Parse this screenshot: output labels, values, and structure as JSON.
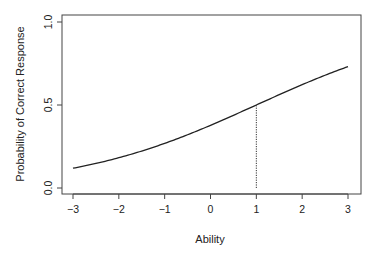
{
  "chart_data": {
    "type": "line",
    "title": "",
    "xlabel": "Ability",
    "ylabel": "Probability of Correct Response",
    "xlim": [
      -3,
      3
    ],
    "ylim": [
      0,
      1
    ],
    "x_ticks": [
      -3,
      -2,
      -1,
      0,
      1,
      2,
      3
    ],
    "x_tick_labels": [
      "−3",
      "−2",
      "−1",
      "0",
      "1",
      "2",
      "3"
    ],
    "y_ticks": [
      0.0,
      0.5,
      1.0
    ],
    "y_tick_labels": [
      "0.0",
      "0.5",
      "1.0"
    ],
    "grid": false,
    "legend": null,
    "series": [
      {
        "name": "Item characteristic curve",
        "model": "logistic",
        "discrimination": 0.5,
        "difficulty": 1,
        "x": [
          -3,
          -2.5,
          -2,
          -1.5,
          -1,
          -0.5,
          0,
          0.5,
          1,
          1.5,
          2,
          2.5,
          3
        ],
        "values": [
          0.12,
          0.15,
          0.18,
          0.22,
          0.27,
          0.32,
          0.38,
          0.44,
          0.5,
          0.56,
          0.62,
          0.68,
          0.73
        ]
      }
    ],
    "annotations": [
      {
        "type": "vline",
        "style": "dotted",
        "x": 1,
        "y_from": 0,
        "y_to": 0.5,
        "description": "difficulty marker at ability 1"
      }
    ]
  }
}
